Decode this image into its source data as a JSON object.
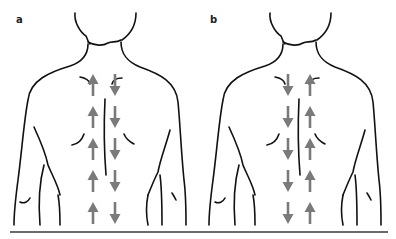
{
  "figure": {
    "panels": [
      {
        "label": "a",
        "left_column_direction": "up",
        "right_column_direction": "down",
        "arrow_count_per_column": 5
      },
      {
        "label": "b",
        "left_column_direction": "down",
        "right_column_direction": "up",
        "arrow_count_per_column": 5
      }
    ],
    "colors": {
      "outline": "#111111",
      "arrow": "#7a7a7a",
      "baseline": "#6b6b6b",
      "background": "#ffffff"
    }
  }
}
